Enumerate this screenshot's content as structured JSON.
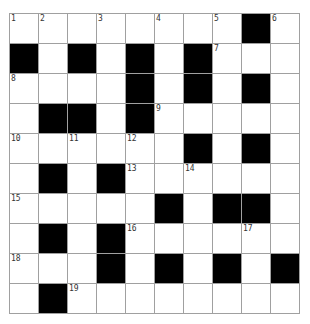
{
  "crossword": {
    "rows": 10,
    "cols": 10,
    "colors": {
      "black": "#000000",
      "white": "#ffffff",
      "line": "#a0a0a0"
    },
    "grid": [
      [
        "1",
        "2",
        "",
        "3",
        "",
        "4",
        "",
        "5",
        "#",
        "6"
      ],
      [
        "#",
        "",
        "#",
        "",
        "#",
        "",
        "#",
        "7",
        "",
        ""
      ],
      [
        "8",
        "",
        "",
        "",
        "#",
        "",
        "#",
        "",
        "#",
        ""
      ],
      [
        "",
        "#",
        "#",
        "",
        "#",
        "9",
        "",
        "",
        "",
        ""
      ],
      [
        "10",
        "",
        "11",
        "",
        "12",
        "",
        "#",
        "",
        "#",
        ""
      ],
      [
        "",
        "#",
        "",
        "#",
        "13",
        "",
        "14",
        "",
        "",
        ""
      ],
      [
        "15",
        "",
        "",
        "",
        "",
        "#",
        "",
        "#",
        "#",
        ""
      ],
      [
        "",
        "#",
        "",
        "#",
        "16",
        "",
        "",
        "",
        "17",
        ""
      ],
      [
        "18",
        "",
        "",
        "#",
        "",
        "#",
        "",
        "#",
        "",
        "#"
      ],
      [
        "",
        "#",
        "19",
        "",
        "",
        "",
        "",
        "",
        "",
        ""
      ]
    ]
  }
}
